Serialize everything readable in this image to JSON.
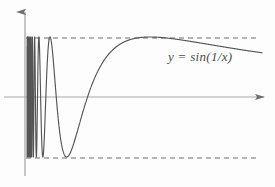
{
  "figure": {
    "label": "y = sin(1/x)",
    "background_color": "#fdfdfd",
    "curve_color": "#555555",
    "axis_color": "#8a8a8a",
    "dashed_color": "#6e6e6e"
  },
  "chart_data": {
    "type": "line",
    "title": "",
    "subtitle": "",
    "xlabel": "",
    "ylabel": "",
    "annotations": [
      {
        "text": "y = sin(1/x)",
        "x_px": 168,
        "y_px": 49
      }
    ],
    "legend": [],
    "legend_position": "none",
    "grid": false,
    "xlim": [
      0,
      1.05
    ],
    "ylim": [
      -1.15,
      1.15
    ],
    "axes": {
      "x_axis": {
        "visible": true,
        "arrow": true,
        "y_value": 0,
        "x_px": 25,
        "y_px": 97,
        "end_x_px": 270
      },
      "y_axis": {
        "visible": true,
        "arrow": true,
        "x_value": 0,
        "x_px": 25,
        "top_y_px": 8,
        "bottom_y_px": 176
      }
    },
    "reference_lines": [
      {
        "name": "upper-asymptote",
        "y": 1,
        "style": "dashed",
        "y_px": 38,
        "x_start_px": 26,
        "x_end_px": 258
      },
      {
        "name": "lower-asymptote",
        "y": -1,
        "style": "dashed",
        "y_px": 158,
        "x_start_px": 26,
        "x_end_px": 258
      }
    ],
    "function": "sin(1/x)",
    "series": [
      {
        "name": "sin(1/x)",
        "expression": "y = sin(1/x)",
        "color": "#555555",
        "maxima_px": [
          93,
          122,
          150
        ],
        "minima_px": [
          108,
          136,
          186
        ],
        "zero_crossings_px": [
          100,
          115,
          129,
          143,
          222
        ],
        "amplitude": 1,
        "oscillation_region_px": [
          26,
          80
        ],
        "note": "oscillations become infinitely dense as x approaches 0"
      }
    ]
  }
}
